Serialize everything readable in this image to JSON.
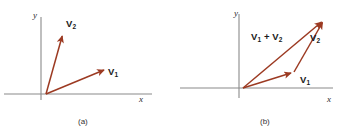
{
  "figure": {
    "background_color": "#ffffff",
    "vector_color": "#9c3a22",
    "axis_color": "#808080",
    "text_color": "#1a1a1a"
  },
  "panels": [
    {
      "id": "a",
      "caption": "(a)",
      "axes": {
        "x_label": "x",
        "y_label": "y",
        "origin": [
          46,
          94
        ],
        "x_axis": [
          4,
          94,
          152,
          94
        ],
        "y_axis": [
          41,
          17,
          41,
          100
        ]
      },
      "vectors": [
        {
          "name": "V1",
          "label_main": "V",
          "label_sub": "1",
          "from": [
            46,
            94
          ],
          "to": [
            107,
            69
          ],
          "label_pos": [
            111,
            70
          ]
        },
        {
          "name": "V2",
          "label_main": "V",
          "label_sub": "2",
          "from": [
            46,
            94
          ],
          "to": [
            63,
            33
          ],
          "label_pos": [
            66,
            19
          ]
        }
      ]
    },
    {
      "id": "b",
      "caption": "(b)",
      "axes": {
        "x_label": "x",
        "y_label": "y",
        "origin": [
          65,
          88
        ],
        "x_axis": [
          2,
          88,
          155,
          88
        ],
        "y_axis": [
          61,
          14,
          61,
          98
        ]
      },
      "vectors": [
        {
          "name": "V1",
          "label_main": "V",
          "label_sub": "1",
          "from": [
            65,
            88
          ],
          "to": [
            116,
            72
          ],
          "label_pos": [
            121,
            76
          ]
        },
        {
          "name": "V2",
          "label_main": "V",
          "label_sub": "2",
          "from": [
            116,
            72
          ],
          "to": [
            146,
            20
          ],
          "label_pos": [
            150,
            34
          ]
        },
        {
          "name": "V1+V2",
          "label_main": "V",
          "label_sub": "1",
          "label_main2": " + V",
          "label_sub2": "2",
          "from": [
            65,
            88
          ],
          "to": [
            146,
            20
          ],
          "label_pos": [
            72,
            31
          ]
        }
      ]
    }
  ],
  "labels": {
    "panel_a_y": "y",
    "panel_a_x": "x",
    "panel_a_v1": "V",
    "panel_a_v1_sub": "1",
    "panel_a_v2": "V",
    "panel_a_v2_sub": "2",
    "panel_a_caption": "(a)",
    "panel_b_y": "y",
    "panel_b_x": "x",
    "panel_b_v1": "V",
    "panel_b_v1_sub": "1",
    "panel_b_v2": "V",
    "panel_b_v2_sub": "2",
    "panel_b_sum_1": "V",
    "panel_b_sum_1_sub": "1",
    "panel_b_sum_plus": " + V",
    "panel_b_sum_2_sub": "2",
    "panel_b_caption": "(b)"
  }
}
